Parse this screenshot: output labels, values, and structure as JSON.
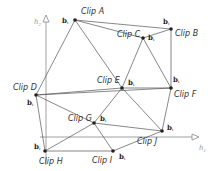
{
  "axes": {
    "x": {
      "label": "h",
      "sub": "1",
      "from": [
        40,
        137
      ],
      "to": [
        192,
        137
      ]
    },
    "y": {
      "label": "h",
      "sub": "2",
      "from": [
        46,
        165
      ],
      "to": [
        46,
        22
      ]
    }
  },
  "clips": [
    {
      "id": "A",
      "label": "Clip A",
      "x": 75,
      "y": 20,
      "lx": 81,
      "ly": 14,
      "basis": "b",
      "bsub": "i",
      "bx": 62,
      "by": 23
    },
    {
      "id": "B",
      "label": "Clip B",
      "x": 171,
      "y": 29,
      "lx": 175,
      "ly": 36,
      "basis": "b",
      "bsub": "i",
      "bx": 163,
      "by": 24
    },
    {
      "id": "C",
      "label": "Clip C",
      "x": 143,
      "y": 38,
      "lx": 117,
      "ly": 37,
      "basis": "b",
      "bsub": "i",
      "bx": 148,
      "by": 40
    },
    {
      "id": "D",
      "label": "Clip D",
      "x": 36,
      "y": 95,
      "lx": 13,
      "ly": 90,
      "basis": "b",
      "bsub": "i",
      "bx": 27,
      "by": 105
    },
    {
      "id": "E",
      "label": "Clip E",
      "x": 122,
      "y": 88,
      "lx": 97,
      "ly": 83,
      "basis": "b",
      "bsub": "i",
      "bx": 128,
      "by": 85
    },
    {
      "id": "F",
      "label": "Clip F",
      "x": 171,
      "y": 88,
      "lx": 174,
      "ly": 97,
      "basis": "b",
      "bsub": "i",
      "bx": 173,
      "by": 82
    },
    {
      "id": "G",
      "label": "Clip G",
      "x": 94,
      "y": 123,
      "lx": 68,
      "ly": 121,
      "basis": "b",
      "bsub": "i",
      "bx": 100,
      "by": 121
    },
    {
      "id": "H",
      "label": "Clip H",
      "x": 45,
      "y": 151,
      "lx": 39,
      "ly": 164,
      "basis": "b",
      "bsub": "i",
      "bx": 34,
      "by": 149
    },
    {
      "id": "I",
      "label": "Clip I",
      "x": 113,
      "y": 151,
      "lx": 92,
      "ly": 163,
      "basis": "b",
      "bsub": "i",
      "bx": 119,
      "by": 159
    },
    {
      "id": "J",
      "label": "Clip J",
      "x": 162,
      "y": 131,
      "lx": 137,
      "ly": 144,
      "basis": "b",
      "bsub": "i",
      "bx": 167,
      "by": 130
    }
  ],
  "edges": [
    [
      "A",
      "B"
    ],
    [
      "A",
      "C"
    ],
    [
      "A",
      "E"
    ],
    [
      "A",
      "D"
    ],
    [
      "C",
      "B"
    ],
    [
      "C",
      "E"
    ],
    [
      "C",
      "F"
    ],
    [
      "B",
      "F"
    ],
    [
      "D",
      "E"
    ],
    [
      "D",
      "G"
    ],
    [
      "D",
      "H"
    ],
    [
      "D",
      "F"
    ],
    [
      "E",
      "F"
    ],
    [
      "E",
      "G"
    ],
    [
      "E",
      "J"
    ],
    [
      "F",
      "J"
    ],
    [
      "G",
      "H"
    ],
    [
      "G",
      "I"
    ],
    [
      "G",
      "J"
    ],
    [
      "H",
      "I"
    ],
    [
      "I",
      "J"
    ]
  ],
  "colors": {
    "edge": "#555555",
    "axis": "#888888",
    "point": "#222222"
  }
}
